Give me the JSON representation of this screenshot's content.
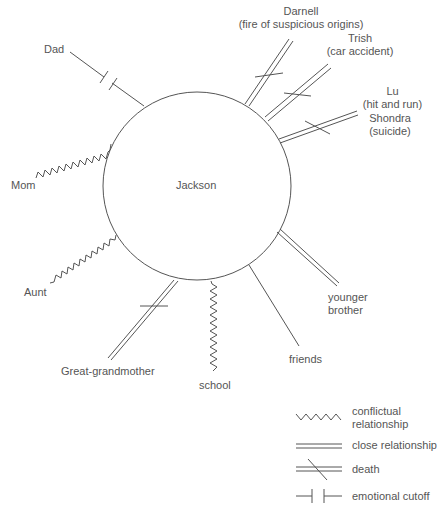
{
  "diagram": {
    "type": "ecomap",
    "center": {
      "label": "Jackson"
    },
    "nodes": [
      {
        "id": "dad",
        "label": "Dad",
        "relationship": "emotional cutoff"
      },
      {
        "id": "darnell",
        "label": "Darnell",
        "note": "(fire of suspicious origins)",
        "relationship": "death"
      },
      {
        "id": "trish",
        "label": "Trish",
        "note": "(car accident)",
        "relationship": "death"
      },
      {
        "id": "lu",
        "label": "Lu",
        "note": "(hit and run)",
        "relationship": "death"
      },
      {
        "id": "shondra",
        "label": "Shondra",
        "note": "(suicide)",
        "relationship": "death"
      },
      {
        "id": "mom",
        "label": "Mom",
        "relationship": "conflictual relationship"
      },
      {
        "id": "aunt",
        "label": "Aunt",
        "relationship": "conflictual relationship"
      },
      {
        "id": "great_grandmother",
        "label": "Great-grandmother",
        "relationship": "death"
      },
      {
        "id": "school",
        "label": "school",
        "relationship": "conflictual relationship"
      },
      {
        "id": "friends",
        "label": "friends",
        "relationship": "relationship"
      },
      {
        "id": "younger_brother",
        "label_line1": "younger",
        "label_line2": "brother",
        "relationship": "close relationship"
      }
    ],
    "legend": [
      {
        "symbol": "zigzag",
        "label_line1": "conflictual",
        "label_line2": "relationship"
      },
      {
        "symbol": "double-line",
        "label": "close relationship"
      },
      {
        "symbol": "double-line-slash",
        "label": "death"
      },
      {
        "symbol": "cutoff",
        "label": "emotional cutoff"
      }
    ],
    "colors": {
      "line": "#555555",
      "text": "#555555",
      "background": "#ffffff"
    }
  }
}
